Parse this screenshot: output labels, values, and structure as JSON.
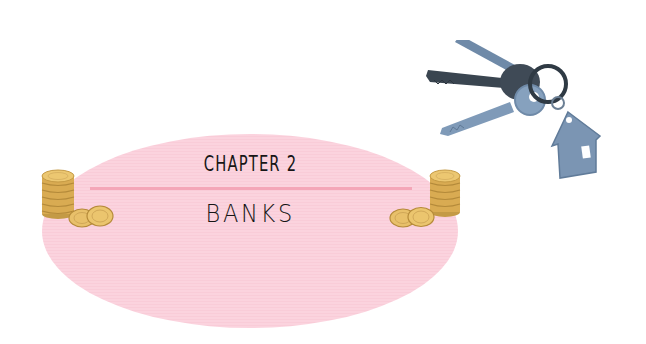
{
  "heading": {
    "chapter_label": "CHAPTER 2",
    "title": "BANKS"
  },
  "decorations": {
    "left_coins": "coin-stack-icon",
    "right_coins": "coin-stack-icon",
    "keys": "house-keys-icon"
  },
  "colors": {
    "ellipse": "#fbd3de",
    "divider": "#f4a6b8",
    "text": "#161616",
    "coin": "#e2b65a",
    "key_dark": "#3b4651",
    "key_blue": "#7c98b6"
  }
}
